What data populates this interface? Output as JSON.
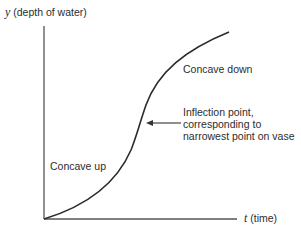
{
  "diagram": {
    "y_axis": {
      "var": "y",
      "label": "(depth of water)"
    },
    "x_axis": {
      "var": "t",
      "label": "(time)"
    },
    "annotations": {
      "concave_down": "Concave down",
      "concave_up": "Concave up",
      "inflection": [
        "Inflection point,",
        "corresponding to",
        "narrowest point on vase"
      ]
    },
    "colors": {
      "axis": "#555555",
      "curve": "#2b2b2b",
      "text": "#2d2d2d"
    }
  }
}
